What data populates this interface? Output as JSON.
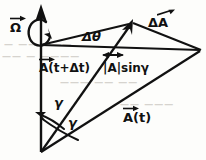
{
  "figure": {
    "width": 206,
    "height": 160,
    "ink_color": "#111111",
    "background_color": "#fdfdfb",
    "faint_bleed_color": "#c9c6c0"
  },
  "labels": {
    "omega": "Ω",
    "delta_theta": "Δθ",
    "delta_A": "ΔA",
    "A_t_plus_dt": "A(t+Δt)",
    "A_magnitude_sin_gamma": "|A|sinγ",
    "A_t": "A(t)",
    "gamma_upper": "γ",
    "gamma_lower": "γ"
  },
  "icons": {
    "rotation_arrow": "curved-rotation-arrow-icon",
    "axis_arrowhead": "up-arrowhead-icon",
    "vector_tip_arrowhead": "filled-arrowhead-icon",
    "angle_arc_arrow_upper": "arc-arrow-icon",
    "angle_arc_arrow_lower": "arc-arrow-icon",
    "measure_arrow": "double-arrow-icon"
  },
  "bleed_text": {
    "line1": "— —— ———",
    "line2": "—— — ————",
    "line3": "——— —— ——",
    "line4": "—— ———"
  },
  "geometry": {
    "origin": [
      41,
      152
    ],
    "axis_top": [
      41,
      6
    ],
    "cone_vertex": [
      41,
      45
    ],
    "tip_t_plus_dt": [
      131,
      23
    ],
    "tip_t": [
      201,
      50
    ],
    "note": "Vector A rotates about the vertical Ω axis sweeping a cone of half-angle gamma"
  }
}
